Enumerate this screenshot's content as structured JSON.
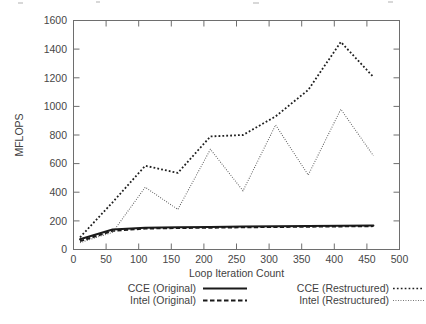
{
  "chart_data": {
    "type": "line",
    "title": "",
    "xlabel": "Loop Iteration Count",
    "ylabel": "MFLOPS",
    "xlim": [
      0,
      500
    ],
    "ylim": [
      0,
      1600
    ],
    "xticks": [
      0,
      50,
      100,
      150,
      200,
      250,
      300,
      350,
      400,
      450,
      500
    ],
    "yticks": [
      0,
      200,
      400,
      600,
      800,
      1000,
      1200,
      1400,
      1600
    ],
    "grid": false,
    "legend_position": "bottom",
    "x": [
      10,
      60,
      110,
      160,
      210,
      260,
      310,
      360,
      410,
      460
    ],
    "series": [
      {
        "name": "CCE (Original)",
        "style": "solid",
        "color": "#1a1a1a",
        "values": [
          72,
          140,
          152,
          155,
          158,
          160,
          162,
          164,
          166,
          168
        ]
      },
      {
        "name": "Intel (Original)",
        "style": "dashed",
        "color": "#1a1a1a",
        "values": [
          58,
          130,
          146,
          150,
          152,
          155,
          157,
          159,
          161,
          163
        ]
      },
      {
        "name": "CCE (Restructured)",
        "style": "dotted-coarse",
        "color": "#1f1f1f",
        "values": [
          85,
          330,
          585,
          535,
          790,
          800,
          930,
          1115,
          1450,
          1205
        ]
      },
      {
        "name": "Intel (Restructured)",
        "style": "dotted-fine",
        "color": "#5a5a5a",
        "values": [
          48,
          120,
          435,
          280,
          700,
          410,
          870,
          520,
          980,
          655
        ]
      }
    ]
  },
  "axes": {
    "y_title": "MFLOPS",
    "x_title": "Loop Iteration Count",
    "y_tick_labels": [
      "0",
      "200",
      "400",
      "600",
      "800",
      "1000",
      "1200",
      "1400",
      "1600"
    ],
    "x_tick_labels": [
      "0",
      "50",
      "100",
      "150",
      "200",
      "250",
      "300",
      "350",
      "400",
      "450",
      "500"
    ]
  },
  "legend": {
    "entries": [
      {
        "label": "CCE (Original)",
        "style": "solid"
      },
      {
        "label": "CCE (Restructured)",
        "style": "dotted-coarse"
      },
      {
        "label": "Intel (Original)",
        "style": "dashed"
      },
      {
        "label": "Intel (Restructured)",
        "style": "dotted-fine"
      }
    ]
  }
}
